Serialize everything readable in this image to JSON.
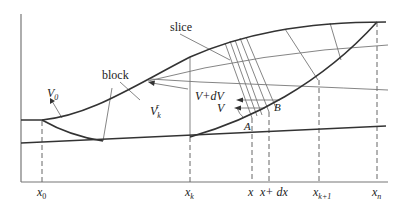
{
  "figure": {
    "colors": {
      "line": "#333333",
      "thin": "#666666",
      "background": "#ffffff"
    }
  },
  "labels": {
    "slice": "slice",
    "block": "block",
    "v0": "V",
    "v0_sub": "0",
    "vk": "V",
    "vk_sub": "k",
    "vk_sup": "r",
    "v_plus_dv": "V+dV",
    "v": "V",
    "point_a": "A",
    "point_b": "B"
  },
  "x_axis_ticks": [
    {
      "id": "x0",
      "base": "x",
      "sub": "0"
    },
    {
      "id": "xk",
      "base": "x",
      "sub": "k"
    },
    {
      "id": "x",
      "base": "x",
      "sub": ""
    },
    {
      "id": "x_dx",
      "base": "x+ dx",
      "sub": ""
    },
    {
      "id": "xk1",
      "base": "x",
      "sub": "k+1"
    },
    {
      "id": "xn",
      "base": "x",
      "sub": "n"
    }
  ]
}
